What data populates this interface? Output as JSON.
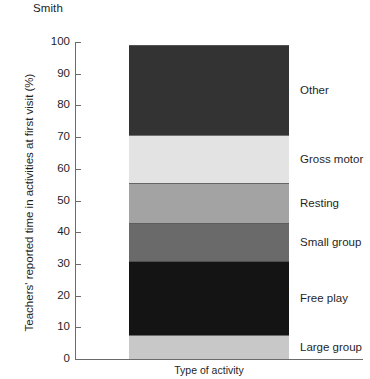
{
  "figure": {
    "caption": "Smith"
  },
  "chart_data": {
    "type": "bar",
    "subtype": "stacked-bar-single-category",
    "title": "Smith",
    "xlabel": "Type of activity",
    "ylabel": "Teachers' reported time in activities at first visit (%)",
    "categories": [
      "Type of activity"
    ],
    "ylim": [
      0,
      100
    ],
    "yticks": [
      0,
      10,
      20,
      30,
      40,
      50,
      60,
      70,
      80,
      90,
      100
    ],
    "ytick_labels": [
      "0",
      "10",
      "20",
      "30",
      "40",
      "50",
      "60",
      "70",
      "80",
      "90",
      "100"
    ],
    "grid": false,
    "legend": "right-inline-labels",
    "total": 99,
    "stack_order_bottom_to_top": [
      "Large group",
      "Free play",
      "Small group",
      "Resting",
      "Gross motor",
      "Other"
    ],
    "segments": [
      {
        "label": "Large group",
        "value": 7.6,
        "start": 0,
        "end": 7.6,
        "color": "#c8c8c8"
      },
      {
        "label": "Free play",
        "value": 23.3,
        "start": 7.6,
        "end": 30.9,
        "color": "#141414"
      },
      {
        "label": "Small group",
        "value": 12.0,
        "start": 30.9,
        "end": 42.9,
        "color": "#6a6a6a"
      },
      {
        "label": "Resting",
        "value": 12.6,
        "start": 42.9,
        "end": 55.5,
        "color": "#a3a3a3"
      },
      {
        "label": "Gross motor",
        "value": 15.2,
        "start": 55.5,
        "end": 70.7,
        "color": "#e3e3e3"
      },
      {
        "label": "Other",
        "value": 28.3,
        "start": 70.7,
        "end": 99.0,
        "color": "#333333"
      }
    ]
  }
}
